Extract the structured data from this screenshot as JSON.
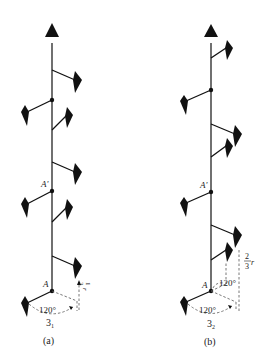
{
  "figures": [
    {
      "id": "a",
      "caption": "(a)",
      "helix_label": "3",
      "helix_sub": "1",
      "point_A": "A",
      "point_A_prime": "A'",
      "angle_label": "120°",
      "rise_label_num": "1",
      "rise_label_den": "3",
      "rise_label_var": "r"
    },
    {
      "id": "b",
      "caption": "(b)",
      "helix_label": "3",
      "helix_sub": "2",
      "point_A": "A",
      "point_A_prime": "A'",
      "angle_label_1": "120°",
      "angle_label_2": "120°",
      "rise_label_num": "2",
      "rise_label_den": "3",
      "rise_label_var": "r"
    }
  ]
}
